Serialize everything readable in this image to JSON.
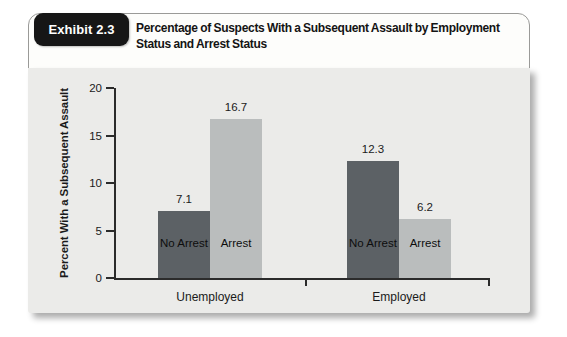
{
  "header": {
    "badge": "Exhibit 2.3",
    "title": "Percentage of Suspects With a Subsequent Assault by Employment Status and Arrest Status"
  },
  "chart_data": {
    "type": "bar",
    "title": "Percentage of Suspects With a Subsequent Assault by Employment Status and Arrest Status",
    "categories": [
      "Unemployed",
      "Employed"
    ],
    "series": [
      {
        "name": "No Arrest",
        "color": "#5c6165",
        "values": [
          7.1,
          12.3
        ]
      },
      {
        "name": "Arrest",
        "color": "#babdbd",
        "values": [
          16.7,
          6.2
        ]
      }
    ],
    "value_labels": [
      "7.1",
      "16.7",
      "12.3",
      "6.2"
    ],
    "xlabel": "",
    "ylabel": "Percent With a Subsequent Assault",
    "ylim": [
      0,
      20
    ],
    "yticks": [
      0,
      5,
      10,
      15,
      20
    ],
    "grid": false,
    "legend_position": "labels-inside-bars"
  },
  "colors": {
    "panel_bg": "#ebebe9",
    "card_bg": "#fdfdfb",
    "card_border": "#9a9a98",
    "badge_bg": "#161616",
    "badge_text": "#ffffff",
    "axis": "#2b2b2b",
    "text": "#1a1a1a",
    "bar_dark": "#5c6165",
    "bar_light": "#babdbd"
  }
}
